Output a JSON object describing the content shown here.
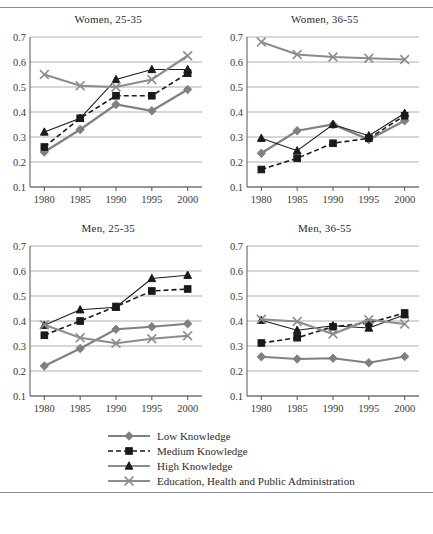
{
  "figure": {
    "series_names": [
      "Low Knowledge",
      "Medium Knowledge",
      "High Knowledge",
      "Education, Health and Public Administration"
    ],
    "colors": {
      "low": "#808080",
      "medium": "#1a1a1a",
      "high": "#1a1a1a",
      "education": "#8c8c8c",
      "gridline": "#b0b0b0",
      "axis": "#555555",
      "rule": "#8a8a96"
    }
  },
  "legend": {
    "items": [
      {
        "label": "Low Knowledge",
        "marker": "diamond-marker",
        "style": "solid",
        "color": "#808080"
      },
      {
        "label": "Medium Knowledge",
        "marker": "square-marker",
        "style": "dashed",
        "color": "#1a1a1a"
      },
      {
        "label": "High Knowledge",
        "marker": "triangle-marker",
        "style": "solid",
        "color": "#1a1a1a"
      },
      {
        "label": "Education, Health and Public Administration",
        "marker": "x-marker",
        "style": "solid",
        "color": "#8c8c8c"
      }
    ]
  },
  "chart_data": [
    {
      "type": "line",
      "title": "Women, 25-35",
      "xlabel": "",
      "ylabel": "",
      "x": [
        1980,
        1985,
        1990,
        1995,
        2000
      ],
      "xticklabels": [
        "1980",
        "1985",
        "1990",
        "1995",
        "2000"
      ],
      "yticklabels": [
        "0.1",
        "0.2",
        "0.3",
        "0.4",
        "0.5",
        "0.6",
        "0.7"
      ],
      "ylim": [
        0.1,
        0.7
      ],
      "xlim": [
        1978,
        2002
      ],
      "grid": true,
      "legend_position": "bottom-shared",
      "series": [
        {
          "name": "Low Knowledge",
          "values": [
            0.24,
            0.33,
            0.43,
            0.405,
            0.49
          ]
        },
        {
          "name": "Medium Knowledge",
          "values": [
            0.26,
            0.375,
            0.465,
            0.465,
            0.555
          ]
        },
        {
          "name": "High Knowledge",
          "values": [
            0.32,
            0.375,
            0.53,
            0.57,
            0.57
          ]
        },
        {
          "name": "Education, Health and Public Administration",
          "values": [
            0.55,
            0.505,
            0.5,
            0.53,
            0.625
          ]
        }
      ]
    },
    {
      "type": "line",
      "title": "Women, 36-55",
      "xlabel": "",
      "ylabel": "",
      "x": [
        1980,
        1985,
        1990,
        1995,
        2000
      ],
      "xticklabels": [
        "1980",
        "1985",
        "1990",
        "1995",
        "2000"
      ],
      "yticklabels": [
        "0.1",
        "0.2",
        "0.3",
        "0.4",
        "0.5",
        "0.6",
        "0.7"
      ],
      "ylim": [
        0.1,
        0.7
      ],
      "xlim": [
        1978,
        2002
      ],
      "grid": true,
      "legend_position": "bottom-shared",
      "series": [
        {
          "name": "Low Knowledge",
          "values": [
            0.235,
            0.325,
            0.35,
            0.29,
            0.365
          ]
        },
        {
          "name": "Medium Knowledge",
          "values": [
            0.17,
            0.215,
            0.275,
            0.295,
            0.385
          ]
        },
        {
          "name": "High Knowledge",
          "values": [
            0.295,
            0.245,
            0.35,
            0.305,
            0.395
          ]
        },
        {
          "name": "Education, Health and Public Administration",
          "values": [
            0.68,
            0.63,
            0.62,
            0.615,
            0.61
          ]
        }
      ]
    },
    {
      "type": "line",
      "title": "Men, 25-35",
      "xlabel": "",
      "ylabel": "",
      "x": [
        1980,
        1985,
        1990,
        1995,
        2000
      ],
      "xticklabels": [
        "1980",
        "1985",
        "1990",
        "1995",
        "2000"
      ],
      "yticklabels": [
        "0.1",
        "0.2",
        "0.3",
        "0.4",
        "0.5",
        "0.6",
        "0.7"
      ],
      "ylim": [
        0.1,
        0.7
      ],
      "xlim": [
        1978,
        2002
      ],
      "grid": true,
      "legend_position": "bottom-shared",
      "series": [
        {
          "name": "Low Knowledge",
          "values": [
            0.22,
            0.29,
            0.367,
            0.377,
            0.389
          ]
        },
        {
          "name": "Medium Knowledge",
          "values": [
            0.343,
            0.4,
            0.458,
            0.52,
            0.528
          ]
        },
        {
          "name": "High Knowledge",
          "values": [
            0.383,
            0.445,
            0.455,
            0.57,
            0.583
          ]
        },
        {
          "name": "Education, Health and Public Administration",
          "values": [
            0.385,
            0.333,
            0.311,
            0.329,
            0.341
          ]
        }
      ]
    },
    {
      "type": "line",
      "title": "Men, 36-55",
      "xlabel": "",
      "ylabel": "",
      "x": [
        1980,
        1985,
        1990,
        1995,
        2000
      ],
      "xticklabels": [
        "1980",
        "1985",
        "1990",
        "1995",
        "2000"
      ],
      "yticklabels": [
        "0.1",
        "0.2",
        "0.3",
        "0.4",
        "0.5",
        "0.6",
        "0.7"
      ],
      "ylim": [
        0.1,
        0.7
      ],
      "xlim": [
        1978,
        2002
      ],
      "grid": true,
      "legend_position": "bottom-shared",
      "series": [
        {
          "name": "Low Knowledge",
          "values": [
            0.257,
            0.248,
            0.251,
            0.233,
            0.258
          ]
        },
        {
          "name": "Medium Knowledge",
          "values": [
            0.312,
            0.333,
            0.377,
            0.392,
            0.432
          ]
        },
        {
          "name": "High Knowledge",
          "values": [
            0.403,
            0.363,
            0.381,
            0.372,
            0.425
          ]
        },
        {
          "name": "Education, Health and Public Administration",
          "values": [
            0.407,
            0.398,
            0.348,
            0.405,
            0.388
          ]
        }
      ]
    }
  ]
}
